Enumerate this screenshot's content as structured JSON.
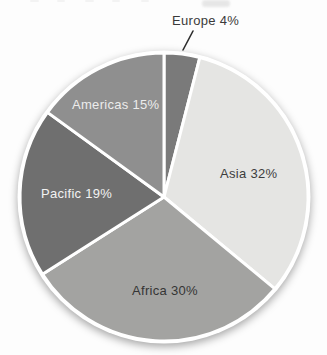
{
  "figure": {
    "background_color": "#fdfdfd",
    "separator_color": "#ffffff",
    "shadow_color": "#bdbdbd",
    "leader_line_color": "#2d2d2d"
  },
  "chart_data": {
    "type": "pie",
    "title": "",
    "start_angle_deg": 0,
    "direction": "clockwise",
    "categories": [
      "Europe",
      "Asia",
      "Africa",
      "Pacific",
      "Americas"
    ],
    "values": [
      4,
      32,
      30,
      19,
      15
    ],
    "unit": "%",
    "legend": "none",
    "slices": [
      {
        "name": "Europe",
        "value": 4,
        "label": "Europe 4%",
        "color": "#7a7a7a",
        "label_color": "#3a3a3a",
        "label_outside": true
      },
      {
        "name": "Asia",
        "value": 32,
        "label": "Asia 32%",
        "color": "#e5e5e3",
        "label_color": "#3d3d3d",
        "label_outside": false
      },
      {
        "name": "Africa",
        "value": 30,
        "label": "Africa 30%",
        "color": "#a3a3a1",
        "label_color": "#353535",
        "label_outside": false
      },
      {
        "name": "Pacific",
        "value": 19,
        "label": "Pacific 19%",
        "color": "#6f6f6f",
        "label_color": "#f2f2f2",
        "label_outside": false
      },
      {
        "name": "Americas",
        "value": 15,
        "label": "Americas 15%",
        "color": "#8f8f8f",
        "label_color": "#ececec",
        "label_outside": false
      }
    ]
  }
}
